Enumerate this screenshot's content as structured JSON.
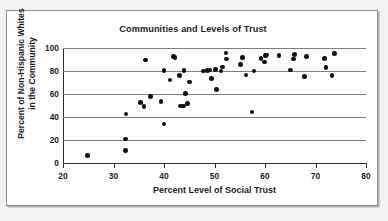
{
  "chart_data": {
    "type": "scatter",
    "title": "Communities and Levels of Trust",
    "xlabel": "Percent Level of Social Trust",
    "ylabel": "Percent of Non-Hispanic Whites in the Community",
    "xlim": [
      20,
      80
    ],
    "ylim": [
      0,
      100
    ],
    "xticks": [
      20,
      30,
      40,
      50,
      60,
      70,
      80
    ],
    "yticks": [
      0,
      20,
      40,
      60,
      80,
      100
    ],
    "grid": "horizontal",
    "legend": "none",
    "marker": "filled-circle",
    "marker_color": "#111111",
    "points": [
      [
        24.9,
        6.5
      ],
      [
        32.4,
        11.0
      ],
      [
        32.4,
        21.0
      ],
      [
        32.5,
        42.5
      ],
      [
        35.4,
        52.5
      ],
      [
        36.0,
        49.0
      ],
      [
        36.3,
        89.5
      ],
      [
        37.3,
        58.0
      ],
      [
        39.4,
        53.5
      ],
      [
        40.0,
        34.0
      ],
      [
        40.0,
        80.5
      ],
      [
        41.2,
        72.0
      ],
      [
        41.9,
        92.5
      ],
      [
        42.2,
        91.5
      ],
      [
        43.1,
        76.0
      ],
      [
        43.3,
        49.5
      ],
      [
        43.9,
        49.5
      ],
      [
        44.0,
        80.5
      ],
      [
        44.3,
        60.5
      ],
      [
        44.6,
        51.5
      ],
      [
        45.0,
        70.5
      ],
      [
        47.8,
        80.0
      ],
      [
        48.6,
        80.5
      ],
      [
        49.1,
        81.0
      ],
      [
        49.4,
        73.5
      ],
      [
        50.2,
        81.5
      ],
      [
        50.4,
        64.0
      ],
      [
        51.3,
        80.0
      ],
      [
        51.6,
        83.5
      ],
      [
        52.3,
        95.5
      ],
      [
        52.4,
        90.5
      ],
      [
        55.2,
        85.5
      ],
      [
        55.6,
        91.5
      ],
      [
        56.2,
        76.5
      ],
      [
        57.4,
        44.5
      ],
      [
        57.8,
        80.0
      ],
      [
        59.2,
        91.0
      ],
      [
        59.9,
        88.0
      ],
      [
        60.1,
        93.5
      ],
      [
        60.3,
        94.0
      ],
      [
        62.8,
        93.5
      ],
      [
        65.0,
        81.0
      ],
      [
        65.6,
        90.5
      ],
      [
        65.8,
        94.5
      ],
      [
        67.8,
        75.0
      ],
      [
        68.2,
        92.5
      ],
      [
        71.8,
        91.0
      ],
      [
        72.1,
        83.0
      ],
      [
        73.3,
        76.0
      ],
      [
        73.8,
        95.0
      ]
    ]
  }
}
